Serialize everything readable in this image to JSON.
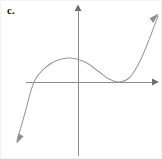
{
  "figure": {
    "label": "c.",
    "width": 162,
    "height": 159,
    "background_color": "#ffffff",
    "border_color": "#f2f2f2"
  },
  "chart_data": {
    "type": "line",
    "title": "c.",
    "xlabel": "",
    "ylabel": "",
    "grid": false,
    "legend": null,
    "axes": {
      "x_axis": {
        "name": "x-axis",
        "color": "#8c8c8c",
        "pixel_y": 81,
        "pixel_x_start": 25,
        "pixel_x_end": 157,
        "arrow_at": "right"
      },
      "y_axis": {
        "name": "y-axis",
        "color": "#8c8c8c",
        "pixel_x": 77,
        "pixel_y_start": 155,
        "pixel_y_end": 4,
        "arrow_at": "top"
      }
    },
    "curve": {
      "name": "cubic-curve",
      "color": "#9a9a9a",
      "stroke_width": 1,
      "description": "Cubic polynomial rising from lower left, local maximum above the x-axis left of the y-axis-right, local minimum tangent to the x-axis, then rising to upper right",
      "arrow_start": "lower-left",
      "arrow_end": "upper-right",
      "points": [
        {
          "x": 16,
          "y": 140
        },
        {
          "x": 24,
          "y": 112
        },
        {
          "x": 33,
          "y": 81
        },
        {
          "x": 45,
          "y": 66
        },
        {
          "x": 57,
          "y": 59
        },
        {
          "x": 70,
          "y": 57
        },
        {
          "x": 84,
          "y": 61
        },
        {
          "x": 97,
          "y": 70
        },
        {
          "x": 108,
          "y": 78
        },
        {
          "x": 118,
          "y": 81
        },
        {
          "x": 128,
          "y": 77
        },
        {
          "x": 137,
          "y": 64
        },
        {
          "x": 146,
          "y": 44
        },
        {
          "x": 157,
          "y": 15
        }
      ],
      "features": [
        {
          "name": "x-intercept-left",
          "x": 33,
          "y": 81
        },
        {
          "name": "local-maximum",
          "x": 70,
          "y": 57
        },
        {
          "name": "local-minimum-tangent-to-x-axis",
          "x": 118,
          "y": 81
        }
      ]
    }
  }
}
